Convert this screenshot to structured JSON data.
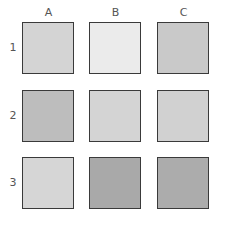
{
  "grid": {
    "columns": [
      "A",
      "B",
      "C"
    ],
    "rows": [
      "1",
      "2",
      "3"
    ],
    "cells": [
      [
        {
          "id": "A1",
          "color": "#d4d4d4"
        },
        {
          "id": "B1",
          "color": "#ebebeb"
        },
        {
          "id": "C1",
          "color": "#c9c9c9"
        }
      ],
      [
        {
          "id": "A2",
          "color": "#bdbdbd"
        },
        {
          "id": "B2",
          "color": "#d4d4d4"
        },
        {
          "id": "C2",
          "color": "#d1d1d1"
        }
      ],
      [
        {
          "id": "A3",
          "color": "#d6d6d6"
        },
        {
          "id": "B3",
          "color": "#a9a9a9"
        },
        {
          "id": "C3",
          "color": "#acacac"
        }
      ]
    ]
  }
}
